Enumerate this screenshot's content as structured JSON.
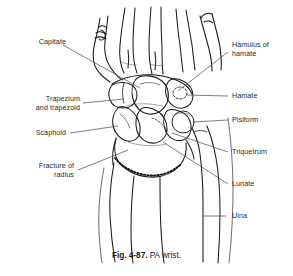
{
  "figure": {
    "caption_figure_number": "Fig. 4-87.",
    "caption_description": "PA wrist.",
    "view": "PA wrist",
    "ink_color": "#1a1a1a",
    "leader_color": "#555555",
    "background_color": "#ffffff"
  },
  "labels": {
    "left": [
      {
        "id": "capitate",
        "text": "Capitate"
      },
      {
        "id": "trapezium-trapezoid",
        "text": "Trapezium\nand trapezoid"
      },
      {
        "id": "scaphoid",
        "text": "Scaphoid"
      },
      {
        "id": "fracture-of-radius",
        "text": "Fracture of\nradius"
      }
    ],
    "right": [
      {
        "id": "hamulus-of-hamate",
        "text": "Hamulus of\nhamate"
      },
      {
        "id": "hamate",
        "text": "Hamate"
      },
      {
        "id": "pisiform",
        "text": "Pisiform"
      },
      {
        "id": "triquetrum",
        "text": "Triquetrum"
      },
      {
        "id": "lunate",
        "text": "Lunate"
      },
      {
        "id": "ulna",
        "text": "Ulna"
      }
    ]
  }
}
